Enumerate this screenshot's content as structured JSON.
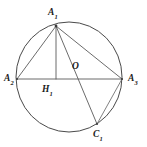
{
  "figure": {
    "kind": "geometry-diagram",
    "background_color": "#ffffff",
    "stroke_color": "#5a5a5a",
    "label_color": "#1a1a1a"
  },
  "circle": {
    "name": "circumcircle",
    "cx": 69,
    "cy": 77,
    "r": 55
  },
  "points": [
    {
      "id": "A1",
      "base": "A",
      "sub": "1",
      "x": 56,
      "y": 26,
      "label_x": 48,
      "label_y": 8
    },
    {
      "id": "A2",
      "base": "A",
      "sub": "2",
      "x": 17,
      "y": 79,
      "label_x": 4,
      "label_y": 74
    },
    {
      "id": "A3",
      "base": "A",
      "sub": "3",
      "x": 122,
      "y": 79,
      "label_x": 128,
      "label_y": 74
    },
    {
      "id": "O",
      "base": "O",
      "sub": "",
      "x": 69,
      "y": 77,
      "label_x": 72,
      "label_y": 62
    },
    {
      "id": "H1",
      "base": "H",
      "sub": "1",
      "x": 56,
      "y": 79,
      "label_x": 42,
      "label_y": 85
    },
    {
      "id": "C1",
      "base": "C",
      "sub": "1",
      "x": 97,
      "y": 124,
      "label_x": 93,
      "label_y": 130
    }
  ],
  "segments": [
    {
      "name": "A1-A2",
      "from": "A1",
      "to": "A2"
    },
    {
      "name": "A1-A3",
      "from": "A1",
      "to": "A3"
    },
    {
      "name": "A2-A3",
      "from": "A2",
      "to": "A3"
    },
    {
      "name": "A1-H1",
      "from": "A1",
      "to": "H1"
    },
    {
      "name": "A1-C1",
      "from": "A1",
      "to": "C1"
    },
    {
      "name": "A3-C1",
      "from": "A3",
      "to": "C1"
    }
  ],
  "labels": {
    "A1": "A",
    "A1_sub": "1",
    "A2": "A",
    "A2_sub": "2",
    "A3": "A",
    "A3_sub": "3",
    "O": "O",
    "H1": "H",
    "H1_sub": "1",
    "C1": "C",
    "C1_sub": "1"
  }
}
